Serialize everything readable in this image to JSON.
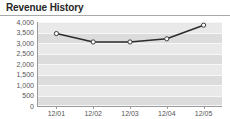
{
  "widget": {
    "title": "Revenue History"
  },
  "chart_data": {
    "type": "line",
    "title": "Revenue History",
    "xlabel": "",
    "ylabel": "",
    "categories": [
      "12/01",
      "12/02",
      "12/03",
      "12/04",
      "12/05"
    ],
    "values": [
      3450,
      3050,
      3050,
      3200,
      3850
    ],
    "series": [
      {
        "name": "Revenue",
        "values": [
          3450,
          3050,
          3050,
          3200,
          3850
        ]
      }
    ],
    "ylim": [
      0,
      4000
    ],
    "ytick_step": 500,
    "ytick_labels": [
      "4,000",
      "3,500",
      "3,000",
      "2,500",
      "2,000",
      "1,500",
      "1,000",
      "500",
      "0"
    ],
    "ytick_values": [
      4000,
      3500,
      3000,
      2500,
      2000,
      1500,
      1000,
      500,
      0
    ],
    "xtick_labels": [
      "12/01",
      "12/02",
      "12/03",
      "12/04",
      "12/05"
    ],
    "grid": true,
    "legend": false,
    "marker": "circle",
    "colors": {
      "line": "#2b2b2b",
      "marker_fill": "#ffffff",
      "plot_background": "#e9e9e9",
      "band": "#dcdcdc",
      "gridline": "#f7f7f7",
      "axis": "#9a9a9a",
      "title_text": "#262626",
      "tick_text": "#555555"
    }
  }
}
